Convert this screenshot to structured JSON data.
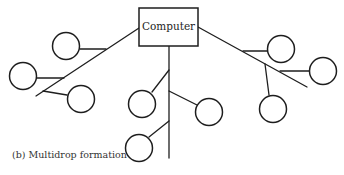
{
  "figure": {
    "caption": "(b)  Multidrop formation",
    "computer_box": {
      "label": "Computer",
      "x": 139,
      "y": 8,
      "w": 59,
      "h": 38
    },
    "colors": {
      "stroke": "#1e1e1e",
      "background": "#ffffff",
      "caption": "#333333"
    }
  },
  "lines": [
    {
      "id": "left-bus",
      "x1": 139,
      "y1": 28,
      "x2": 36,
      "y2": 96
    },
    {
      "id": "left-stub-a",
      "x1": 80,
      "y1": 49,
      "x2": 106,
      "y2": 49
    },
    {
      "id": "left-stub-b",
      "x1": 37,
      "y1": 78,
      "x2": 64,
      "y2": 78
    },
    {
      "id": "left-stub-c",
      "x1": 43,
      "y1": 91,
      "x2": 67,
      "y2": 95
    },
    {
      "id": "center-bus",
      "x1": 169,
      "y1": 46,
      "x2": 169,
      "y2": 158
    },
    {
      "id": "center-stub-1",
      "x1": 169,
      "y1": 70,
      "x2": 152,
      "y2": 92
    },
    {
      "id": "center-stub-2",
      "x1": 169,
      "y1": 91,
      "x2": 197,
      "y2": 105
    },
    {
      "id": "center-stub-3",
      "x1": 169,
      "y1": 121,
      "x2": 149,
      "y2": 137
    },
    {
      "id": "right-bus",
      "x1": 198,
      "y1": 27,
      "x2": 307,
      "y2": 87
    },
    {
      "id": "right-stub-e",
      "x1": 243,
      "y1": 51,
      "x2": 267,
      "y2": 51
    },
    {
      "id": "right-stub-f",
      "x1": 280,
      "y1": 71,
      "x2": 309,
      "y2": 71
    },
    {
      "id": "right-stub-g",
      "x1": 265,
      "y1": 64,
      "x2": 269,
      "y2": 95
    }
  ],
  "nodes": [
    {
      "id": "terminal-left-1",
      "cx": 66,
      "cy": 46,
      "r": 13.5
    },
    {
      "id": "terminal-left-2",
      "cx": 23,
      "cy": 76,
      "r": 13.5
    },
    {
      "id": "terminal-left-3",
      "cx": 81,
      "cy": 99,
      "r": 13.5
    },
    {
      "id": "terminal-center-1",
      "cx": 142,
      "cy": 104,
      "r": 13.5
    },
    {
      "id": "terminal-center-2",
      "cx": 209,
      "cy": 112,
      "r": 13.5
    },
    {
      "id": "terminal-center-3",
      "cx": 139,
      "cy": 148,
      "r": 13.5
    },
    {
      "id": "terminal-right-1",
      "cx": 281,
      "cy": 49,
      "r": 13.5
    },
    {
      "id": "terminal-right-2",
      "cx": 323,
      "cy": 71,
      "r": 13.5
    },
    {
      "id": "terminal-right-3",
      "cx": 273,
      "cy": 109,
      "r": 13.5
    }
  ]
}
